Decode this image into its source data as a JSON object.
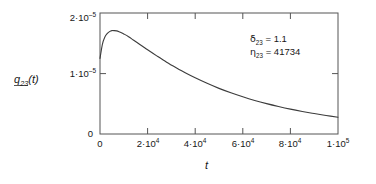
{
  "chart_data": {
    "type": "line",
    "title": "",
    "xlabel": "t",
    "ylabel": "q,23(t)",
    "xlim": [
      0,
      100000
    ],
    "ylim": [
      0,
      2.4e-05
    ],
    "grid": false,
    "legend": null,
    "xticks": [
      {
        "value": 0,
        "label_mantissa": "0",
        "label_sep": "",
        "label_base": "",
        "label_exp": ""
      },
      {
        "value": 20000,
        "label_mantissa": "2",
        "label_sep": "·",
        "label_base": "10",
        "label_exp": "4"
      },
      {
        "value": 40000,
        "label_mantissa": "4",
        "label_sep": "·",
        "label_base": "10",
        "label_exp": "4"
      },
      {
        "value": 60000,
        "label_mantissa": "6",
        "label_sep": "·",
        "label_base": "10",
        "label_exp": "4"
      },
      {
        "value": 80000,
        "label_mantissa": "8",
        "label_sep": "·",
        "label_base": "10",
        "label_exp": "4"
      },
      {
        "value": 100000,
        "label_mantissa": "1",
        "label_sep": "·",
        "label_base": "10",
        "label_exp": "5"
      }
    ],
    "yticks": [
      {
        "value": 0,
        "label_mantissa": "0",
        "label_sep": "",
        "label_base": "",
        "label_exp": ""
      },
      {
        "value": 1e-05,
        "label_mantissa": "1",
        "label_sep": "·",
        "label_base": "10",
        "label_exp": "–5"
      },
      {
        "value": 2e-05,
        "label_mantissa": "2",
        "label_sep": "·",
        "label_base": "10",
        "label_exp": "–5"
      }
    ],
    "series": [
      {
        "name": "q,23(t)",
        "color": "#3c3c3c",
        "x": [
          0,
          1000,
          2000,
          3000,
          4000,
          5000,
          6000,
          7000,
          8000,
          9000,
          10000,
          12000,
          14000,
          16000,
          18000,
          20000,
          24000,
          28000,
          32000,
          36000,
          40000,
          45000,
          50000,
          55000,
          60000,
          65000,
          70000,
          75000,
          80000,
          85000,
          90000,
          95000,
          100000
        ],
        "y": [
          1.5e-05,
          1.78e-05,
          1.92e-05,
          1.99e-05,
          2.03e-05,
          2.05e-05,
          2.05e-05,
          2.045e-05,
          2.03e-05,
          2.01e-05,
          1.985e-05,
          1.93e-05,
          1.865e-05,
          1.8e-05,
          1.735e-05,
          1.67e-05,
          1.545e-05,
          1.425e-05,
          1.315e-05,
          1.21e-05,
          1.115e-05,
          1.005e-05,
          9.05e-06,
          8.18e-06,
          7.38e-06,
          6.66e-06,
          6.02e-06,
          5.45e-06,
          4.93e-06,
          4.47e-06,
          4.05e-06,
          3.67e-06,
          3.33e-06
        ]
      }
    ],
    "annotations": [
      {
        "symbol": "δ",
        "subscript": "23",
        "equals": "=",
        "value": "1.1"
      },
      {
        "symbol": "η",
        "subscript": "23",
        "equals": "=",
        "value": "41734"
      }
    ]
  },
  "ylabel_parts": {
    "q": "q",
    "sub": "23",
    "paren_open": "(",
    "t": "t",
    "paren_close": ")"
  },
  "colors": {
    "axis": "#555555",
    "curve": "#3c3c3c",
    "text": "#171717",
    "background": "#ffffff"
  }
}
